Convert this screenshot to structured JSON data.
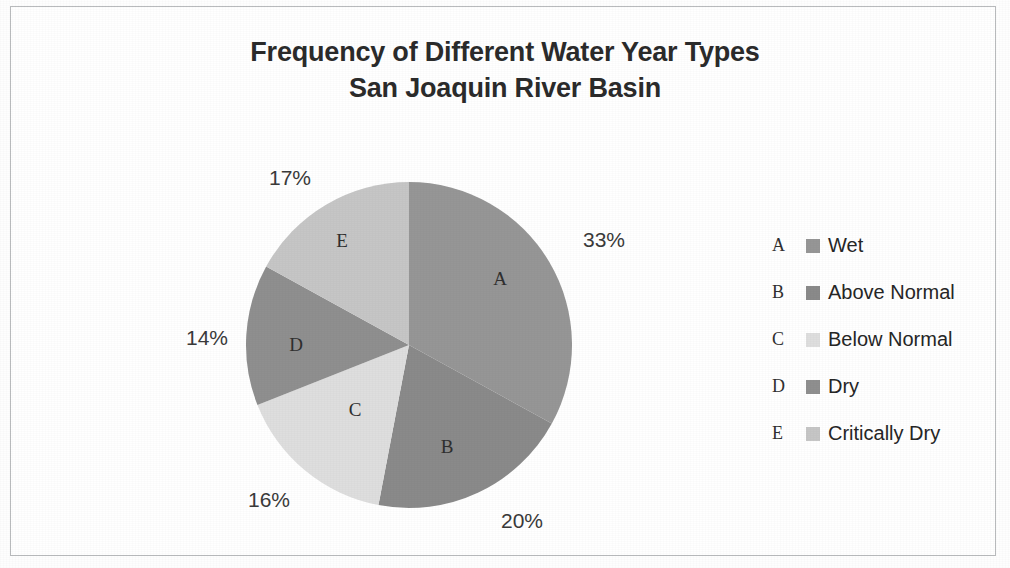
{
  "figure": {
    "title_line1": "Frequency of Different Water Year Types",
    "title_line2": "San Joaquin River Basin"
  },
  "chart_data": {
    "type": "pie",
    "title": "Frequency of Different Water Year Types San Joaquin River Basin",
    "subtitle": "San Joaquin River Basin",
    "xlabel": "",
    "ylabel": "",
    "grid": false,
    "legend_position": "right",
    "start_angle_deg": 0,
    "direction": "clockwise",
    "categories": [
      "Wet",
      "Above Normal",
      "Below Normal",
      "Dry",
      "Critically Dry"
    ],
    "keys": [
      "A",
      "B",
      "C",
      "D",
      "E"
    ],
    "values": [
      33,
      20,
      16,
      14,
      17
    ],
    "value_labels": [
      "33%",
      "20%",
      "16%",
      "14%",
      "17%"
    ],
    "colors": [
      "#969696",
      "#8a8a8a",
      "#dedede",
      "#8f8f8f",
      "#c6c6c6"
    ],
    "slices": [
      {
        "key": "A",
        "label": "Wet",
        "value": 33,
        "value_label": "33%",
        "color": "#969696"
      },
      {
        "key": "B",
        "label": "Above Normal",
        "value": 20,
        "value_label": "20%",
        "color": "#8a8a8a"
      },
      {
        "key": "C",
        "label": "Below Normal",
        "value": 16,
        "value_label": "16%",
        "color": "#dedede"
      },
      {
        "key": "D",
        "label": "Dry",
        "value": 14,
        "value_label": "14%",
        "color": "#8f8f8f"
      },
      {
        "key": "E",
        "label": "Critically Dry",
        "value": 17,
        "value_label": "17%",
        "color": "#c6c6c6"
      }
    ]
  },
  "legend": {
    "items": [
      {
        "key": "A",
        "label": "Wet",
        "color": "#969696"
      },
      {
        "key": "B",
        "label": "Above Normal",
        "color": "#8a8a8a"
      },
      {
        "key": "C",
        "label": "Below Normal",
        "color": "#dedede"
      },
      {
        "key": "D",
        "label": "Dry",
        "color": "#8f8f8f"
      },
      {
        "key": "E",
        "label": "Critically Dry",
        "color": "#c6c6c6"
      }
    ]
  },
  "pct_labels": [
    {
      "text": "33%",
      "x": 604,
      "y": 240
    },
    {
      "text": "20%",
      "x": 522,
      "y": 521
    },
    {
      "text": "16%",
      "x": 269,
      "y": 500
    },
    {
      "text": "14%",
      "x": 207,
      "y": 338
    },
    {
      "text": "17%",
      "x": 290,
      "y": 178
    }
  ],
  "slice_letters": [
    {
      "text": "A",
      "x": 500,
      "y": 279
    },
    {
      "text": "B",
      "x": 447,
      "y": 447
    },
    {
      "text": "C",
      "x": 355,
      "y": 410
    },
    {
      "text": "D",
      "x": 296,
      "y": 345
    },
    {
      "text": "E",
      "x": 342,
      "y": 241
    }
  ]
}
